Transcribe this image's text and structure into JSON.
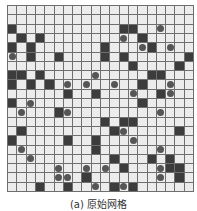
{
  "figure": {
    "caption": "(a) 原始网格",
    "rows": 20,
    "cols": 20,
    "colors": {
      "free": "#ececec",
      "obstacle": "#3c3c3c",
      "grid_line": "#6f6f6f",
      "dot": "#555555"
    },
    "obstacles": [
      [
        2,
        0
      ],
      [
        2,
        12
      ],
      [
        2,
        13
      ],
      [
        3,
        1
      ],
      [
        3,
        3
      ],
      [
        3,
        14
      ],
      [
        4,
        0
      ],
      [
        4,
        2
      ],
      [
        4,
        10
      ],
      [
        4,
        15
      ],
      [
        5,
        2
      ],
      [
        5,
        5
      ],
      [
        5,
        10
      ],
      [
        5,
        12
      ],
      [
        5,
        19
      ],
      [
        6,
        13
      ],
      [
        6,
        18
      ],
      [
        7,
        0
      ],
      [
        7,
        1
      ],
      [
        7,
        3
      ],
      [
        7,
        15
      ],
      [
        7,
        16
      ],
      [
        8,
        0
      ],
      [
        8,
        2
      ],
      [
        8,
        4
      ],
      [
        8,
        14
      ],
      [
        9,
        6
      ],
      [
        9,
        9
      ],
      [
        9,
        16
      ],
      [
        10,
        0
      ],
      [
        10,
        14
      ],
      [
        11,
        5
      ],
      [
        12,
        10
      ],
      [
        12,
        12
      ],
      [
        12,
        13
      ],
      [
        13,
        1
      ],
      [
        13,
        11
      ],
      [
        13,
        18
      ],
      [
        14,
        0
      ],
      [
        14,
        6
      ],
      [
        14,
        9
      ],
      [
        15,
        9
      ],
      [
        16,
        11
      ],
      [
        16,
        15
      ],
      [
        16,
        17
      ],
      [
        17,
        12
      ],
      [
        17,
        17
      ],
      [
        17,
        18
      ],
      [
        18,
        8
      ],
      [
        18,
        18
      ],
      [
        19,
        3
      ],
      [
        19,
        6
      ],
      [
        19,
        11
      ],
      [
        19,
        13
      ]
    ],
    "dots": [
      [
        2,
        16
      ],
      [
        3,
        12
      ],
      [
        4,
        14
      ],
      [
        4,
        17
      ],
      [
        5,
        0
      ],
      [
        7,
        9
      ],
      [
        8,
        6
      ],
      [
        8,
        8
      ],
      [
        8,
        11
      ],
      [
        8,
        17
      ],
      [
        9,
        13
      ],
      [
        9,
        17
      ],
      [
        10,
        2
      ],
      [
        11,
        1
      ],
      [
        11,
        6
      ],
      [
        11,
        16
      ],
      [
        13,
        12
      ],
      [
        14,
        13
      ],
      [
        15,
        1
      ],
      [
        15,
        16
      ],
      [
        16,
        2
      ],
      [
        17,
        5
      ],
      [
        17,
        8
      ],
      [
        17,
        10
      ],
      [
        17,
        16
      ],
      [
        18,
        5
      ],
      [
        18,
        6
      ],
      [
        18,
        16
      ],
      [
        19,
        9
      ],
      [
        19,
        12
      ]
    ]
  }
}
